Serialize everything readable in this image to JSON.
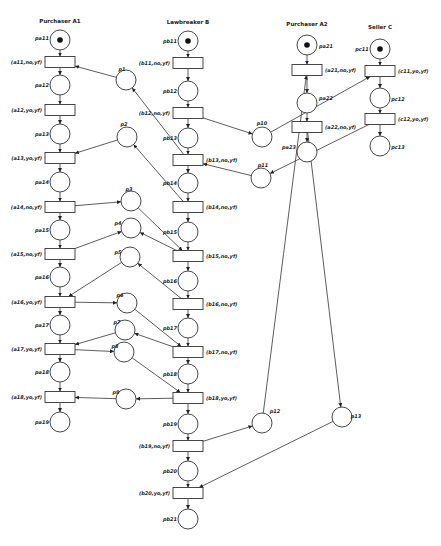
{
  "diagram": {
    "type": "petri-net",
    "actors": [
      {
        "id": "A1",
        "title": "Purchaser A1",
        "x": 60,
        "y": 23
      },
      {
        "id": "B",
        "title": "Lawbreaker B",
        "x": 188,
        "y": 24
      },
      {
        "id": "A2",
        "title": "Purchaser A2",
        "x": 307,
        "y": 26
      },
      {
        "id": "C",
        "title": "Seller C",
        "x": 380,
        "y": 29
      }
    ],
    "places": [
      {
        "id": "pa11",
        "label": "pa11",
        "x": 60,
        "y": 40,
        "token": true,
        "lx": 42,
        "ly": 38
      },
      {
        "id": "pa12",
        "label": "pa12",
        "x": 60,
        "y": 85,
        "lx": 42,
        "ly": 85
      },
      {
        "id": "pa13",
        "label": "pa13",
        "x": 60,
        "y": 134,
        "lx": 42,
        "ly": 134
      },
      {
        "id": "pa14",
        "label": "pa14",
        "x": 60,
        "y": 182,
        "lx": 42,
        "ly": 182
      },
      {
        "id": "pa15",
        "label": "pa15",
        "x": 60,
        "y": 230,
        "lx": 42,
        "ly": 230
      },
      {
        "id": "pa16",
        "label": "pa16",
        "x": 60,
        "y": 277,
        "lx": 42,
        "ly": 277
      },
      {
        "id": "pa17",
        "label": "pa17",
        "x": 60,
        "y": 325,
        "lx": 42,
        "ly": 325
      },
      {
        "id": "pa18",
        "label": "pa18",
        "x": 60,
        "y": 372,
        "lx": 42,
        "ly": 372
      },
      {
        "id": "pa19",
        "label": "pa19",
        "x": 60,
        "y": 422,
        "lx": 42,
        "ly": 422
      },
      {
        "id": "pb11",
        "label": "pb11",
        "x": 188,
        "y": 41,
        "token": true,
        "lx": 170,
        "ly": 41
      },
      {
        "id": "pb12",
        "label": "pb12",
        "x": 188,
        "y": 91,
        "lx": 170,
        "ly": 91
      },
      {
        "id": "pb13",
        "label": "pb13",
        "x": 188,
        "y": 138,
        "lx": 170,
        "ly": 138
      },
      {
        "id": "pb14",
        "label": "pb14",
        "x": 188,
        "y": 183,
        "lx": 170,
        "ly": 183
      },
      {
        "id": "pb15",
        "label": "pb15",
        "x": 188,
        "y": 232,
        "lx": 170,
        "ly": 232
      },
      {
        "id": "pb16",
        "label": "pb16",
        "x": 188,
        "y": 281,
        "lx": 170,
        "ly": 281
      },
      {
        "id": "pb17",
        "label": "pb17",
        "x": 188,
        "y": 328,
        "lx": 170,
        "ly": 328
      },
      {
        "id": "pb18",
        "label": "pb18",
        "x": 188,
        "y": 374,
        "lx": 170,
        "ly": 374
      },
      {
        "id": "pb19",
        "label": "pb19",
        "x": 188,
        "y": 424,
        "lx": 170,
        "ly": 424
      },
      {
        "id": "pb20",
        "label": "pb20",
        "x": 188,
        "y": 471,
        "lx": 170,
        "ly": 471
      },
      {
        "id": "pb21",
        "label": "pb21",
        "x": 188,
        "y": 519,
        "lx": 170,
        "ly": 519
      },
      {
        "id": "pa21",
        "label": "pa21",
        "x": 307,
        "y": 45,
        "token": true,
        "lx": 326,
        "ly": 46
      },
      {
        "id": "pa22",
        "label": "pa22",
        "x": 307,
        "y": 103,
        "lx": 326,
        "ly": 98
      },
      {
        "id": "pa23",
        "label": "pa23",
        "x": 307,
        "y": 152,
        "lx": 289,
        "ly": 147
      },
      {
        "id": "pc11",
        "label": "pc11",
        "x": 380,
        "y": 49,
        "token": true,
        "lx": 362,
        "ly": 49
      },
      {
        "id": "pc12",
        "label": "pc12",
        "x": 380,
        "y": 98,
        "lx": 398,
        "ly": 99
      },
      {
        "id": "pc13",
        "label": "pc13",
        "x": 380,
        "y": 146,
        "lx": 398,
        "ly": 147
      },
      {
        "id": "p1",
        "label": "p1",
        "x": 126,
        "y": 80,
        "lx": 122,
        "ly": 69
      },
      {
        "id": "p2",
        "label": "p2",
        "x": 127,
        "y": 137,
        "lx": 124,
        "ly": 124
      },
      {
        "id": "p3",
        "label": "p3",
        "x": 131,
        "y": 201,
        "lx": 129,
        "ly": 189
      },
      {
        "id": "p4",
        "label": "p4",
        "x": 131,
        "y": 228,
        "lx": 118,
        "ly": 223
      },
      {
        "id": "p5",
        "label": "p5",
        "x": 130,
        "y": 257,
        "lx": 118,
        "ly": 252
      },
      {
        "id": "p6",
        "label": "p6",
        "x": 127,
        "y": 303,
        "lx": 120,
        "ly": 295
      },
      {
        "id": "p7",
        "label": "p7",
        "x": 125,
        "y": 330,
        "lx": 117,
        "ly": 322
      },
      {
        "id": "p8",
        "label": "p8",
        "x": 124,
        "y": 352,
        "lx": 115,
        "ly": 346
      },
      {
        "id": "p9",
        "label": "p9",
        "x": 126,
        "y": 399,
        "lx": 116,
        "ly": 392
      },
      {
        "id": "p10",
        "label": "p10",
        "x": 262,
        "y": 137,
        "lx": 262,
        "ly": 123
      },
      {
        "id": "p11",
        "label": "p11",
        "x": 261,
        "y": 178,
        "lx": 263,
        "ly": 165
      },
      {
        "id": "p12",
        "label": "p12",
        "x": 262,
        "y": 423,
        "lx": 275,
        "ly": 411
      },
      {
        "id": "p13",
        "label": "p13",
        "x": 342,
        "y": 417,
        "lx": 356,
        "ly": 416
      }
    ],
    "transitions": [
      {
        "id": "a11",
        "label": "(a11,no,yf)",
        "x": 60,
        "y": 62,
        "side": "left"
      },
      {
        "id": "a12",
        "label": "(a12,yo,yf)",
        "x": 60,
        "y": 110,
        "side": "left"
      },
      {
        "id": "a13",
        "label": "(a13,yo,yf)",
        "x": 60,
        "y": 158,
        "side": "left"
      },
      {
        "id": "a14",
        "label": "(a14,no,yf)",
        "x": 60,
        "y": 207,
        "side": "left"
      },
      {
        "id": "a15",
        "label": "(a15,no,yf)",
        "x": 60,
        "y": 254,
        "side": "left"
      },
      {
        "id": "a16",
        "label": "(a16,yo,yf)",
        "x": 60,
        "y": 302,
        "side": "left"
      },
      {
        "id": "a17",
        "label": "(a17,yo,yf)",
        "x": 60,
        "y": 349,
        "side": "left"
      },
      {
        "id": "a18",
        "label": "(a18,yo,yf)",
        "x": 60,
        "y": 397,
        "side": "left"
      },
      {
        "id": "b11",
        "label": "(b11,no,yf)",
        "x": 188,
        "y": 63,
        "side": "left"
      },
      {
        "id": "b12",
        "label": "(b12,no,yf)",
        "x": 188,
        "y": 113,
        "side": "left"
      },
      {
        "id": "b13",
        "label": "(b13,no,yf)",
        "x": 188,
        "y": 160,
        "side": "right"
      },
      {
        "id": "b14",
        "label": "(b14,no,yf)",
        "x": 188,
        "y": 207,
        "side": "right"
      },
      {
        "id": "b15",
        "label": "(b15,no,yf)",
        "x": 188,
        "y": 256,
        "side": "right"
      },
      {
        "id": "b16",
        "label": "(b16,no,yf)",
        "x": 188,
        "y": 304,
        "side": "right"
      },
      {
        "id": "b17",
        "label": "(b17,no,yf)",
        "x": 188,
        "y": 352,
        "side": "right"
      },
      {
        "id": "b18",
        "label": "(b18,yo,yf)",
        "x": 188,
        "y": 398,
        "side": "right"
      },
      {
        "id": "b19",
        "label": "(b19,no,yf)",
        "x": 188,
        "y": 446,
        "side": "left"
      },
      {
        "id": "b20",
        "label": "(b20,yo,yf)",
        "x": 188,
        "y": 493,
        "side": "left"
      },
      {
        "id": "a21",
        "label": "(a21,no,yf)",
        "x": 307,
        "y": 70,
        "side": "right"
      },
      {
        "id": "a22",
        "label": "(a22,no,yf)",
        "x": 307,
        "y": 127,
        "side": "right"
      },
      {
        "id": "c11",
        "label": "(c11,yo,yf)",
        "x": 380,
        "y": 71,
        "side": "right"
      },
      {
        "id": "c12",
        "label": "(c12,yo,yf)",
        "x": 380,
        "y": 119,
        "side": "right"
      }
    ],
    "arcs": [
      [
        "pa11",
        "a11"
      ],
      [
        "a11",
        "pa12"
      ],
      [
        "pa12",
        "a12"
      ],
      [
        "a12",
        "pa13"
      ],
      [
        "pa13",
        "a13"
      ],
      [
        "a13",
        "pa14"
      ],
      [
        "pa14",
        "a14"
      ],
      [
        "a14",
        "pa15"
      ],
      [
        "pa15",
        "a15"
      ],
      [
        "a15",
        "pa16"
      ],
      [
        "pa16",
        "a16"
      ],
      [
        "a16",
        "pa17"
      ],
      [
        "pa17",
        "a17"
      ],
      [
        "a17",
        "pa18"
      ],
      [
        "pa18",
        "a18"
      ],
      [
        "a18",
        "pa19"
      ],
      [
        "pb11",
        "b11"
      ],
      [
        "b11",
        "pb12"
      ],
      [
        "pb12",
        "b12"
      ],
      [
        "b12",
        "pb13"
      ],
      [
        "pb13",
        "b13"
      ],
      [
        "b13",
        "pb14"
      ],
      [
        "pb14",
        "b14"
      ],
      [
        "b14",
        "pb15"
      ],
      [
        "pb15",
        "b15"
      ],
      [
        "b15",
        "pb16"
      ],
      [
        "pb16",
        "b16"
      ],
      [
        "b16",
        "pb17"
      ],
      [
        "pb17",
        "b17"
      ],
      [
        "b17",
        "pb18"
      ],
      [
        "pb18",
        "b18"
      ],
      [
        "b18",
        "pb19"
      ],
      [
        "pb19",
        "b19"
      ],
      [
        "b19",
        "pb20"
      ],
      [
        "pb20",
        "b20"
      ],
      [
        "b20",
        "pb21"
      ],
      [
        "pa21",
        "a21"
      ],
      [
        "a21",
        "pa22"
      ],
      [
        "pa22",
        "a22"
      ],
      [
        "a22",
        "pa23"
      ],
      [
        "pc11",
        "c11"
      ],
      [
        "c11",
        "pc12"
      ],
      [
        "pc12",
        "c12"
      ],
      [
        "c12",
        "pc13"
      ],
      [
        "p1",
        "a11"
      ],
      [
        "b13",
        "p1"
      ],
      [
        "p2",
        "a13"
      ],
      [
        "b14",
        "p2"
      ],
      [
        "a14",
        "p3"
      ],
      [
        "p3",
        "b15"
      ],
      [
        "a15",
        "p4"
      ],
      [
        "b15",
        "p4"
      ],
      [
        "p5",
        "a16"
      ],
      [
        "b16",
        "p5"
      ],
      [
        "a16",
        "p6"
      ],
      [
        "p6",
        "b17"
      ],
      [
        "p7",
        "a17"
      ],
      [
        "b17",
        "p7"
      ],
      [
        "a17",
        "p8"
      ],
      [
        "p8",
        "b18"
      ],
      [
        "p9",
        "a18"
      ],
      [
        "b18",
        "p9"
      ],
      [
        "b12",
        "p10"
      ],
      [
        "p10",
        "c11"
      ],
      [
        "c12",
        "p11"
      ],
      [
        "p11",
        "b13"
      ],
      [
        "b19",
        "p12"
      ],
      [
        "p12",
        "a21"
      ],
      [
        "a22",
        "p13"
      ],
      [
        "p13",
        "b20"
      ]
    ]
  }
}
